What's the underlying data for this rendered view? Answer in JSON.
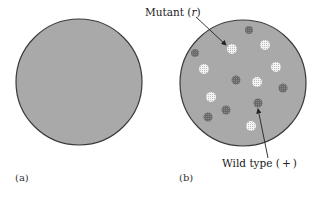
{
  "panels": [
    {
      "label": "(a)",
      "description": "bacterial lawn without plaques"
    },
    {
      "label": "(b)",
      "description": "bacterial lawn with mutant and wild-type plaques"
    }
  ],
  "annotations": {
    "mutant": {
      "text": "Mutant (r)",
      "prefix": "Mutant ",
      "symbol": "r"
    },
    "wild_type": {
      "text": "Wild type (+)",
      "prefix": "Wild type ",
      "symbol": "+"
    }
  },
  "colors": {
    "lawn": "#a9a9a9",
    "outline": "#3a3a3a",
    "wild_plaque": "#6e6e6e",
    "mutant_plaque": "#f2f2f2"
  },
  "dishes": {
    "a": {
      "cx": 79,
      "cy": 82,
      "r": 63
    },
    "b": {
      "cx": 243,
      "cy": 83,
      "r": 63
    }
  },
  "plaques": {
    "wild_type": [
      [
        249,
        30
      ],
      [
        195,
        53
      ],
      [
        236,
        80
      ],
      [
        283,
        88
      ],
      [
        258,
        103
      ],
      [
        226,
        110
      ],
      [
        208,
        117
      ]
    ],
    "mutant": [
      [
        232,
        49
      ],
      [
        265,
        45
      ],
      [
        276,
        67
      ],
      [
        204,
        69
      ],
      [
        257,
        82
      ],
      [
        211,
        97
      ],
      [
        251,
        126
      ]
    ]
  }
}
